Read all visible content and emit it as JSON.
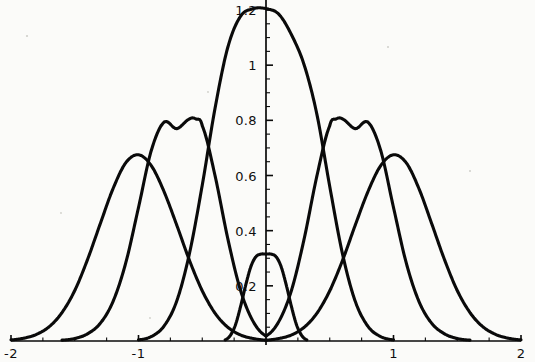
{
  "chart_data": {
    "type": "line",
    "title": "",
    "subtitle": "",
    "xlabel": "",
    "ylabel": "",
    "xlim": [
      -2,
      2
    ],
    "ylim": [
      0,
      1.25
    ],
    "grid": false,
    "legend_position": "none",
    "background_color": "#fbfbf9",
    "line_color": "#0a0a0a",
    "x_ticks": [
      {
        "value": -2,
        "label": "-2"
      },
      {
        "value": -1,
        "label": "-1"
      },
      {
        "value": 1,
        "label": "1"
      },
      {
        "value": 2,
        "label": "2"
      }
    ],
    "x_minor_ticks": [
      -1.75,
      -1.5,
      -1.25,
      -0.75,
      -0.5,
      -0.25,
      0.25,
      0.5,
      0.75,
      1.25,
      1.5,
      1.75
    ],
    "y_ticks": [
      {
        "value": 0.2,
        "label": "0.2"
      },
      {
        "value": 0.4,
        "label": "0.4"
      },
      {
        "value": 0.6,
        "label": "0.6"
      },
      {
        "value": 0.8,
        "label": "0.8"
      },
      {
        "value": 1.0,
        "label": "1"
      },
      {
        "value": 1.2,
        "label": "1.2"
      }
    ],
    "y_minor_ticks": [
      0.05,
      0.1,
      0.15,
      0.25,
      0.3,
      0.35,
      0.45,
      0.5,
      0.55,
      0.65,
      0.7,
      0.75,
      0.85,
      0.9,
      0.95,
      1.05,
      1.1,
      1.15
    ],
    "series": [
      {
        "name": "curve-1-outer-left",
        "peak_x": -1.0,
        "peak_y": 0.675,
        "half_width": 0.62,
        "comment": "broad lobe centered left of -1",
        "points_x": [
          -2.0,
          -1.9,
          -1.8,
          -1.7,
          -1.6,
          -1.5,
          -1.4,
          -1.3,
          -1.2,
          -1.1,
          -1.0,
          -0.9,
          -0.8,
          -0.7,
          -0.6,
          -0.5,
          -0.4,
          -0.3,
          -0.2,
          -0.1,
          0.0
        ],
        "points_y": [
          0.004,
          0.01,
          0.024,
          0.052,
          0.103,
          0.183,
          0.295,
          0.425,
          0.552,
          0.646,
          0.675,
          0.636,
          0.542,
          0.42,
          0.292,
          0.182,
          0.101,
          0.05,
          0.022,
          0.009,
          0.003
        ]
      },
      {
        "name": "curve-2-mid-left",
        "peak_x": -0.55,
        "peak_y": 0.805,
        "half_width": 0.42,
        "points_x": [
          -1.6,
          -1.5,
          -1.4,
          -1.3,
          -1.2,
          -1.1,
          -1.0,
          -0.9,
          -0.8,
          -0.7,
          -0.6,
          -0.55,
          -0.5,
          -0.4,
          -0.3,
          -0.2,
          -0.1,
          0.0
        ],
        "points_y": [
          0.003,
          0.009,
          0.026,
          0.064,
          0.143,
          0.283,
          0.484,
          0.69,
          0.793,
          0.77,
          0.805,
          0.805,
          0.78,
          0.6,
          0.372,
          0.184,
          0.07,
          0.018
        ]
      },
      {
        "name": "curve-3-central-tall",
        "peak_x": 0.0,
        "peak_y": 1.205,
        "half_width": 0.33,
        "points_x": [
          -1.0,
          -0.9,
          -0.8,
          -0.7,
          -0.6,
          -0.5,
          -0.4,
          -0.3,
          -0.2,
          -0.1,
          0.0,
          0.1,
          0.2,
          0.3,
          0.4,
          0.5,
          0.6,
          0.7,
          0.8,
          0.9,
          1.0
        ],
        "points_y": [
          0.004,
          0.016,
          0.054,
          0.145,
          0.318,
          0.565,
          0.843,
          1.064,
          1.177,
          1.205,
          1.205,
          1.185,
          1.11,
          1.0,
          0.82,
          0.56,
          0.316,
          0.144,
          0.053,
          0.016,
          0.004
        ]
      },
      {
        "name": "curve-4-mid-right",
        "peak_x": 0.55,
        "peak_y": 0.805,
        "half_width": 0.42,
        "points_x": [
          0.0,
          0.1,
          0.2,
          0.3,
          0.4,
          0.5,
          0.55,
          0.6,
          0.7,
          0.8,
          0.9,
          1.0,
          1.1,
          1.2,
          1.3,
          1.4,
          1.5,
          1.6
        ],
        "points_y": [
          0.018,
          0.07,
          0.184,
          0.372,
          0.6,
          0.78,
          0.805,
          0.805,
          0.77,
          0.793,
          0.69,
          0.484,
          0.283,
          0.143,
          0.064,
          0.026,
          0.009,
          0.003
        ]
      },
      {
        "name": "curve-5-outer-right",
        "peak_x": 1.0,
        "peak_y": 0.675,
        "half_width": 0.62,
        "points_x": [
          0.0,
          0.1,
          0.2,
          0.3,
          0.4,
          0.5,
          0.6,
          0.7,
          0.8,
          0.9,
          1.0,
          1.1,
          1.2,
          1.3,
          1.4,
          1.5,
          1.6,
          1.7,
          1.8,
          1.9,
          2.0
        ],
        "points_y": [
          0.003,
          0.009,
          0.022,
          0.05,
          0.101,
          0.182,
          0.292,
          0.42,
          0.542,
          0.636,
          0.675,
          0.646,
          0.552,
          0.425,
          0.295,
          0.183,
          0.103,
          0.052,
          0.024,
          0.01,
          0.004
        ]
      },
      {
        "name": "curve-6-central-small",
        "peak_x": 0.0,
        "peak_y": 0.315,
        "half_width": 0.16,
        "points_x": [
          -0.32,
          -0.28,
          -0.24,
          -0.2,
          -0.16,
          -0.12,
          -0.08,
          -0.04,
          0.0,
          0.04,
          0.08,
          0.12,
          0.16,
          0.2,
          0.24,
          0.28,
          0.32
        ],
        "points_y": [
          0.004,
          0.02,
          0.058,
          0.124,
          0.201,
          0.268,
          0.305,
          0.315,
          0.315,
          0.315,
          0.305,
          0.268,
          0.201,
          0.124,
          0.058,
          0.02,
          0.004
        ]
      }
    ],
    "annotations": []
  },
  "axes": {
    "origin_label": "",
    "x_axis_name": "x-axis",
    "y_axis_name": "y-axis"
  }
}
